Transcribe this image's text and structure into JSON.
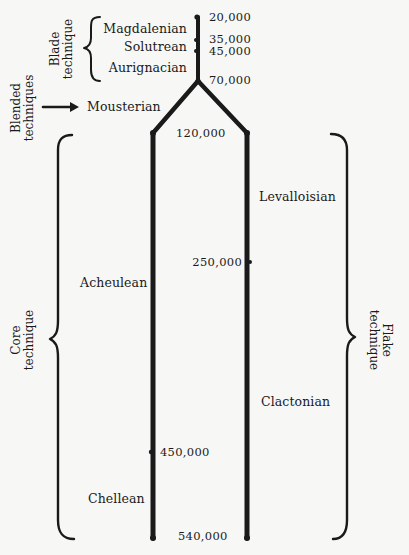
{
  "diagram": {
    "type": "stone-tool-technique-timeline",
    "groups": {
      "blade": {
        "line1": "Blade",
        "line2": "technique"
      },
      "blended": {
        "line1": "Blended",
        "line2": "techniques"
      },
      "core": {
        "line1": "Core",
        "line2": "technique"
      },
      "flake": {
        "line1": "Flake",
        "line2": "technique"
      }
    },
    "industries": {
      "magdalenian": "Magdalenian",
      "solutrean": "Solutrean",
      "aurignacian": "Aurignacian",
      "mousterian": "Mousterian",
      "acheulean": "Acheulean",
      "chellean": "Chellean",
      "levalloisian": "Levalloisian",
      "clactonian": "Clactonian"
    },
    "dates": {
      "d20000": "20,000",
      "d35000": "35,000",
      "d45000": "45,000",
      "d70000": "70,000",
      "d120000": "120,000",
      "d250000": "250,000",
      "d450000": "450,000",
      "d540000": "540,000"
    },
    "colors": {
      "ink": "#1a1a1a",
      "paper": "#f7f7f5"
    }
  }
}
